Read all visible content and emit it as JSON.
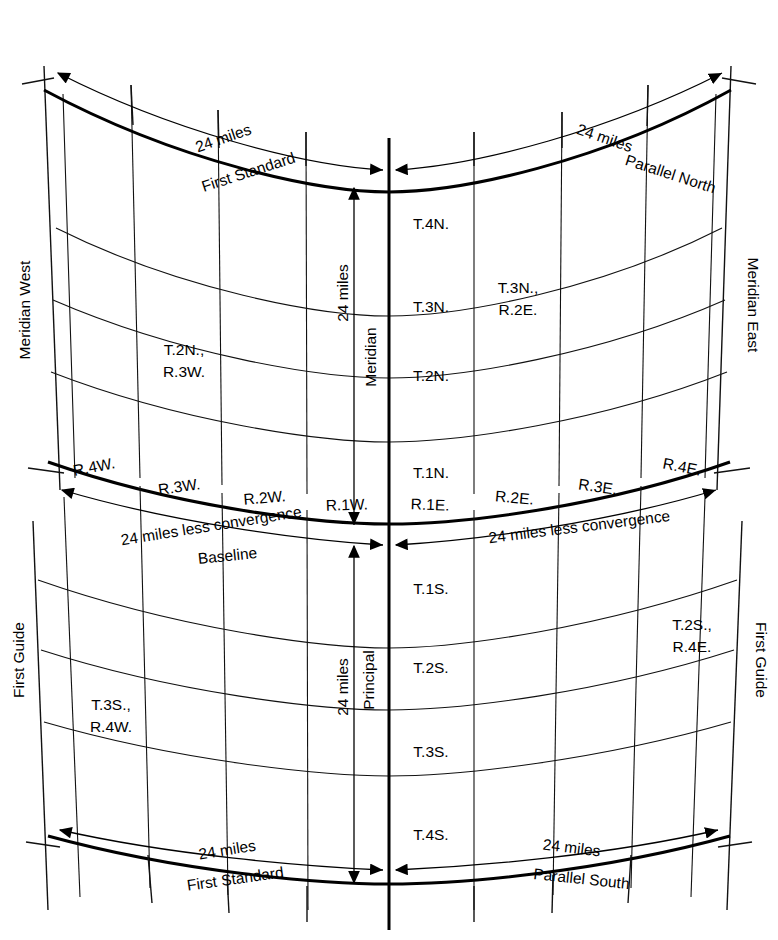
{
  "diagram": {
    "line_color": "#111111",
    "background": "#ffffff"
  },
  "boundaries": {
    "top_left_label": "First Standard",
    "top_right_label": "Parallel North",
    "bottom_left_label": "First Standard",
    "bottom_right_label": "Parallel South",
    "middle_label": "Baseline",
    "left_upper_label": "Meridian West",
    "right_upper_label": "Meridian East",
    "left_lower_label": "First Guide",
    "right_lower_label": "First Guide",
    "meridian_label_upper": "Meridian",
    "meridian_label_lower": "Principal"
  },
  "dimensions": {
    "top_left": "24 miles",
    "top_right": "24 miles",
    "bottom_left": "24 miles",
    "bottom_right": "24 miles",
    "mid_left": "24 miles less convergence",
    "mid_right": "24 miles less convergence",
    "vertical_upper": "24 miles",
    "vertical_lower": "24 miles"
  },
  "ranges": {
    "west": [
      "R.4W.",
      "R.3W.",
      "R.2W.",
      "R.1W."
    ],
    "east": [
      "R.1E.",
      "R.2E.",
      "R.3E.",
      "R.4E."
    ]
  },
  "townships": {
    "north": [
      "T.4N.",
      "T.3N.",
      "T.2N.",
      "T.1N."
    ],
    "south": [
      "T.1S.",
      "T.2S.",
      "T.3S.",
      "T.4S."
    ]
  },
  "cell_labels": {
    "t2n_r3w": [
      "T.2N.,",
      "R.3W."
    ],
    "t3n_r2e": [
      "T.3N.,",
      "R.2E."
    ],
    "t3s_r4w": [
      "T.3S.,",
      "R.4W."
    ],
    "t2s_r4e": [
      "T.2S.,",
      "R.4E."
    ]
  }
}
